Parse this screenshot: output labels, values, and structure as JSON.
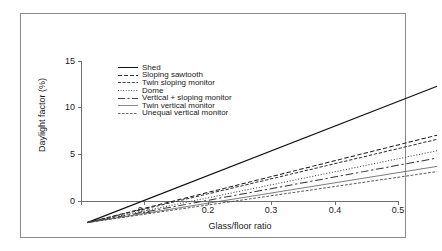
{
  "chart_data": {
    "type": "line",
    "title": "",
    "xlabel": "Glass/floor ratio",
    "ylabel": "Daylight factor (%)",
    "xlim": [
      0,
      0.5
    ],
    "ylim": [
      0,
      15
    ],
    "xticks": [
      "0",
      "0.1",
      "0.2",
      "0.3",
      "0.4",
      "0.5"
    ],
    "xtick_values": [
      0,
      0.1,
      0.2,
      0.3,
      0.4,
      0.5
    ],
    "yticks": [
      "0",
      "5",
      "10",
      "15"
    ],
    "ytick_values": [
      0,
      5,
      10,
      15
    ],
    "grid": false,
    "legend_position": "upper-left-inside",
    "x": [
      0,
      0.5
    ],
    "series": [
      {
        "name": "Shed",
        "dash": "solid",
        "values": [
          0,
          13.1
        ]
      },
      {
        "name": "Sloping sawtooth",
        "dash": "dashed",
        "values": [
          0,
          8.4
        ]
      },
      {
        "name": "Twin sloping monitor",
        "dash": "dash-short",
        "values": [
          0,
          8.0
        ]
      },
      {
        "name": "Dome",
        "dash": "dotted",
        "values": [
          0,
          6.9
        ]
      },
      {
        "name": "Vertical + sloping monitor",
        "dash": "dash-dot-long",
        "values": [
          0,
          6.2
        ]
      },
      {
        "name": "Twin vertical monitor",
        "dash": "solid-thin",
        "values": [
          0,
          5.4
        ]
      },
      {
        "name": "Unequal vertical monitor",
        "dash": "dashed-fine",
        "values": [
          0,
          4.9
        ]
      }
    ]
  }
}
